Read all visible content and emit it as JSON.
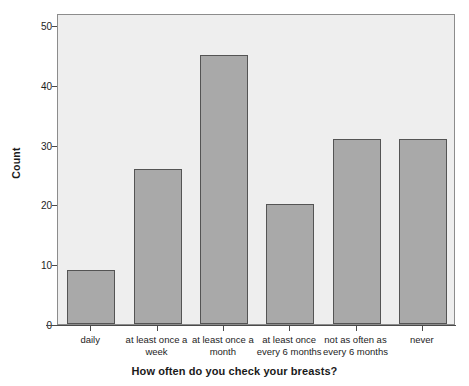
{
  "chart_data": {
    "type": "bar",
    "title": "",
    "xlabel": "How often do you check your breasts?",
    "ylabel": "Count",
    "categories": [
      "daily",
      "at least once a week",
      "at least once a month",
      "at least once every 6 months",
      "not as often as every 6 months",
      "never"
    ],
    "category_lines": [
      [
        "daily"
      ],
      [
        "at least once a",
        "week"
      ],
      [
        "at least once a",
        "month"
      ],
      [
        "at least once",
        "every 6 months"
      ],
      [
        "not as often as",
        "every 6 months"
      ],
      [
        "never"
      ]
    ],
    "values": [
      9,
      26,
      45,
      20,
      31,
      31
    ],
    "ylim": [
      0,
      52
    ],
    "yticks": [
      0,
      10,
      20,
      30,
      40,
      50
    ],
    "ytick_labels": [
      "0",
      "10",
      "20",
      "30",
      "40",
      "50"
    ],
    "grid": false,
    "legend": null,
    "colors": {
      "bar_fill": "#a9a9a9",
      "bar_edge": "#545454",
      "plot_background": "#eeeeee",
      "frame": "#8c8c8c",
      "axis": "#4a4a4a",
      "text": "#1d1d1d"
    }
  }
}
